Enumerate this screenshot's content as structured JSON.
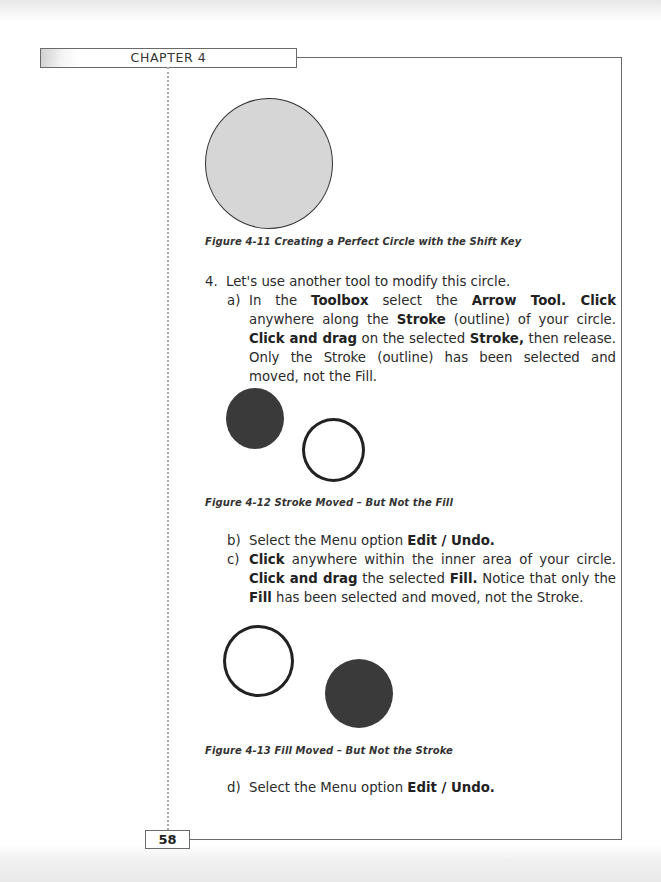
{
  "header": {
    "chapter_label": "CHAPTER 4"
  },
  "figures": [
    {
      "id": "fig-4-11",
      "caption": "Figure 4-11  Creating a Perfect Circle with the Shift Key",
      "shapes": [
        {
          "type": "circle",
          "fill": "#d6d6d6",
          "stroke": "#333333"
        }
      ]
    },
    {
      "id": "fig-4-12",
      "caption": "Figure 4-12  Stroke Moved – But Not the Fill",
      "shapes": [
        {
          "type": "filled-circle",
          "fill": "#3a3a3a"
        },
        {
          "type": "ring",
          "stroke": "#222222"
        }
      ]
    },
    {
      "id": "fig-4-13",
      "caption": "Figure 4-13  Fill Moved – But Not the Stroke",
      "shapes": [
        {
          "type": "ring",
          "stroke": "#222222"
        },
        {
          "type": "filled-circle",
          "fill": "#3a3a3a"
        }
      ]
    }
  ],
  "steps": {
    "step4": {
      "marker": "4.",
      "text": "Let's use another tool to modify this circle."
    },
    "a": {
      "marker": "a)",
      "segments": [
        {
          "t": "In the ",
          "b": false
        },
        {
          "t": "Toolbox",
          "b": true
        },
        {
          "t": " select the ",
          "b": false
        },
        {
          "t": "Arrow Tool. Click",
          "b": true
        },
        {
          "t": " anywhere along the ",
          "b": false
        },
        {
          "t": "Stroke",
          "b": true
        },
        {
          "t": " (outline) of your circle. ",
          "b": false
        },
        {
          "t": "Click and drag",
          "b": true
        },
        {
          "t": " on the selected ",
          "b": false
        },
        {
          "t": "Stroke,",
          "b": true
        },
        {
          "t": " then release. Only the Stroke (outline) has been selected and moved, not the Fill.",
          "b": false
        }
      ]
    },
    "b": {
      "marker": "b)",
      "segments": [
        {
          "t": "Select the Menu option ",
          "b": false
        },
        {
          "t": "Edit / Undo.",
          "b": true
        }
      ]
    },
    "c": {
      "marker": "c)",
      "segments": [
        {
          "t": "Click",
          "b": true
        },
        {
          "t": " anywhere within the inner area of your circle. ",
          "b": false
        },
        {
          "t": "Click and drag",
          "b": true
        },
        {
          "t": " the selected ",
          "b": false
        },
        {
          "t": "Fill.",
          "b": true
        },
        {
          "t": " Notice that only the ",
          "b": false
        },
        {
          "t": "Fill",
          "b": true
        },
        {
          "t": " has been selected and moved, not the Stroke.",
          "b": false
        }
      ]
    },
    "d": {
      "marker": "d)",
      "segments": [
        {
          "t": "Select the Menu option ",
          "b": false
        },
        {
          "t": "Edit / Undo.",
          "b": true
        }
      ]
    }
  },
  "footer": {
    "page_number": "58"
  }
}
